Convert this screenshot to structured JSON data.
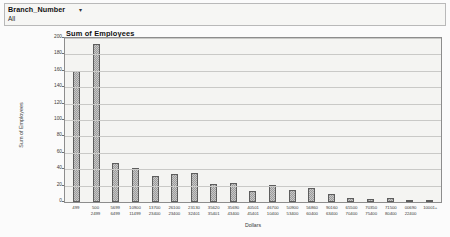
{
  "filter": {
    "field_label": "Branch_Number",
    "caret_icon": "chevron-down-icon",
    "selected_value": "All"
  },
  "chart": {
    "title": "Sum of Employees"
  },
  "chart_data": {
    "type": "bar",
    "title": "Sum of Employees",
    "xlabel": "Dollars",
    "ylabel": "Sum of Employees",
    "ylim": [
      0,
      200
    ],
    "ytick_step": 20,
    "yticks": [
      "0",
      "20",
      "40",
      "60",
      "80",
      "100",
      "120",
      "140",
      "160",
      "180",
      "200"
    ],
    "grid": true,
    "legend": "none",
    "bar_color": "#9b9b9b",
    "bar_border_color": "#5d5d5d",
    "plot_background": "#f4f4f2",
    "categories": [
      "499",
      "500-2499",
      "5699-6499",
      "10900-11499",
      "13700-23400",
      "26100-23400",
      "23130-32401",
      "35620-35401",
      "35690-43400",
      "40501-45401",
      "46700-10400",
      "50900-53400",
      "56860-60400",
      "90160-63400",
      "65500-70400",
      "70350-75400",
      "71500-80400",
      "00690-22400",
      "10001+"
    ],
    "category_lines": [
      [
        "499",
        ""
      ],
      [
        "500",
        "2499"
      ],
      [
        "5699",
        "6499"
      ],
      [
        "10900",
        "11499"
      ],
      [
        "13700",
        "23400"
      ],
      [
        "26100",
        "23400"
      ],
      [
        "23130",
        "32401"
      ],
      [
        "35620",
        "35401"
      ],
      [
        "35690",
        "43400"
      ],
      [
        "40501",
        "45401"
      ],
      [
        "46700",
        "10400"
      ],
      [
        "50900",
        "53400"
      ],
      [
        "56860",
        "60400"
      ],
      [
        "90160",
        "63400"
      ],
      [
        "65500",
        "70400"
      ],
      [
        "70350",
        "75400"
      ],
      [
        "71500",
        "80400"
      ],
      [
        "00690",
        "22400"
      ],
      [
        "10001+",
        ""
      ]
    ],
    "values": [
      160,
      193,
      47,
      42,
      32,
      34,
      35,
      22,
      23,
      13,
      21,
      15,
      17,
      10,
      5,
      4,
      5,
      1,
      3
    ]
  }
}
